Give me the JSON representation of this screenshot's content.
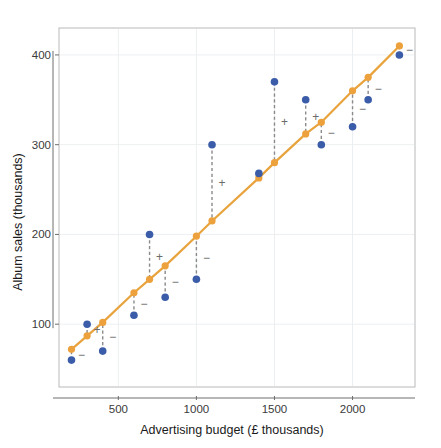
{
  "chart_data": {
    "type": "scatter",
    "title": "",
    "subtitle": "",
    "xlabel": "Advertising budget (£ thousands)",
    "ylabel": "Album sales (thousands)",
    "xlim": [
      120,
      2400
    ],
    "ylim": [
      30,
      430
    ],
    "xticks": [
      500,
      1000,
      1500,
      2000
    ],
    "xtick_labels": [
      "500",
      "1000",
      "1500",
      "2000"
    ],
    "yticks": [
      100,
      200,
      300,
      400
    ],
    "ytick_labels": [
      "100",
      "200",
      "300",
      "400"
    ],
    "grid": true,
    "legend": "none",
    "colors": {
      "observed": "#3b5ca8",
      "predicted": "#eda13c",
      "regression_line": "#e8a33d",
      "residual_line": "#8a8a8a",
      "grid": "#eceff1",
      "frame": "#b9b9b9",
      "text": "#1a1a1a"
    },
    "x": [
      200,
      300,
      400,
      600,
      700,
      800,
      1000,
      1100,
      1400,
      1500,
      1700,
      1800,
      2000,
      2100,
      2300
    ],
    "series": [
      {
        "name": "Observed album sales",
        "marker": "circle",
        "color": "#3b5ca8",
        "values": [
          60,
          100,
          70,
          110,
          200,
          130,
          150,
          300,
          268,
          370,
          350,
          300,
          320,
          350,
          400
        ]
      },
      {
        "name": "Predicted (regression line)",
        "marker": "circle",
        "color": "#eda13c",
        "values": [
          72,
          87,
          102,
          135,
          150,
          165,
          198,
          215,
          263,
          280,
          312,
          325,
          360,
          375,
          410
        ]
      }
    ],
    "residual_signs": [
      "−",
      "+",
      "−",
      "−",
      "+",
      "−",
      "−",
      "+",
      "",
      "+",
      "+",
      "−",
      "−",
      "−",
      "−"
    ]
  }
}
